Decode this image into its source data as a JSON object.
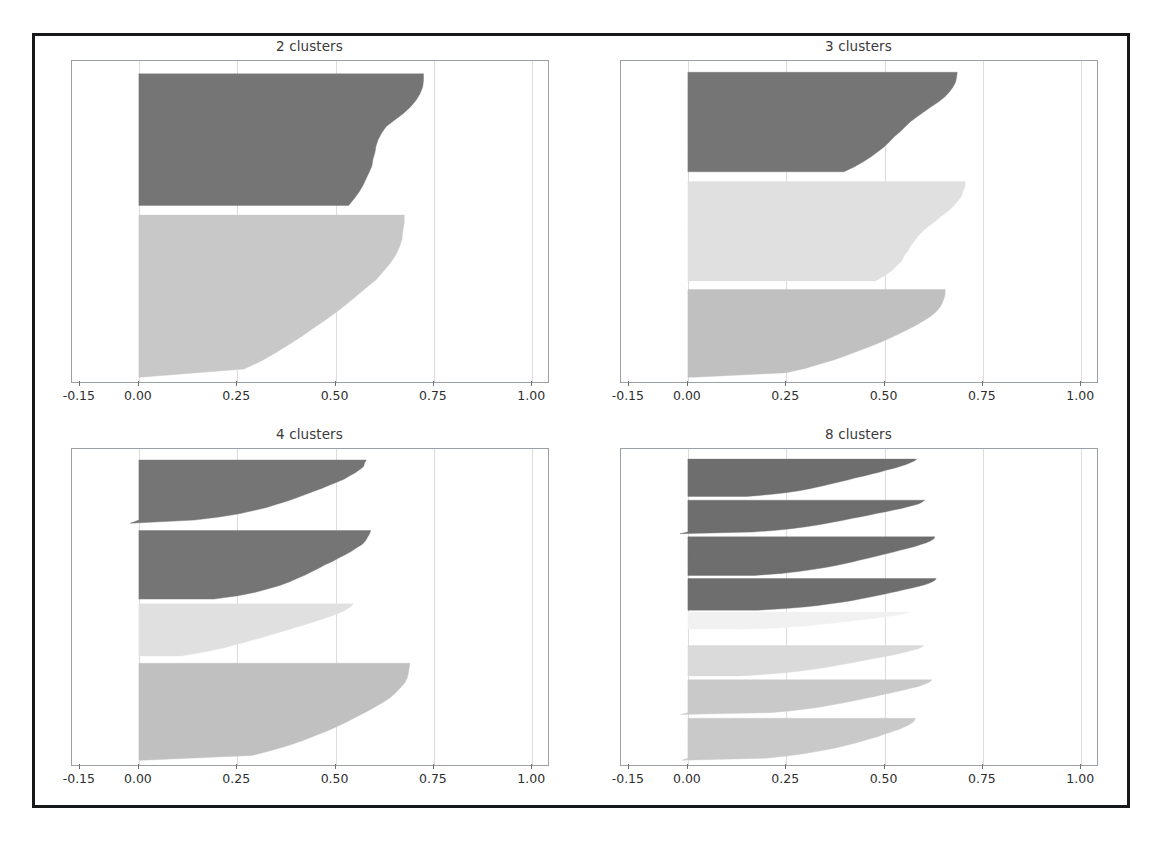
{
  "figure": {
    "kind": "silhouette-plot-grid",
    "background": "#ffffff",
    "frame_color": "#16181a",
    "axis_color": "#9aa0a6",
    "grid_color": "#dcdcdc",
    "tick_label_color": "#2f2f2f",
    "title_color": "#3a3a3a"
  },
  "axis": {
    "tick_labels": [
      "-0.15",
      "0.00",
      "0.25",
      "0.50",
      "0.75",
      "1.00"
    ],
    "tick_values": [
      -0.15,
      0.0,
      0.25,
      0.5,
      0.75,
      1.0
    ],
    "xlim": [
      -0.17,
      1.04
    ],
    "gridline_values": [
      0.0,
      0.25,
      0.5,
      0.75,
      1.0
    ]
  },
  "subplots": [
    {
      "title": "2 clusters",
      "n_clusters": 2
    },
    {
      "title": "3 clusters",
      "n_clusters": 3
    },
    {
      "title": "4 clusters",
      "n_clusters": 4
    },
    {
      "title": "8 clusters",
      "n_clusters": 8
    }
  ],
  "chart_data": {
    "type": "area",
    "xlabel": "",
    "ylabel": "",
    "xlim": [
      -0.17,
      1.04
    ],
    "xticks": [
      -0.15,
      0.0,
      0.25,
      0.5,
      0.75,
      1.0
    ],
    "xticklabels": [
      "-0.15",
      "0.00",
      "0.25",
      "0.50",
      "0.75",
      "1.00"
    ],
    "grid": true,
    "legend": "none",
    "panels": [
      {
        "title": "2 clusters",
        "n_clusters": 2,
        "y_span": [
          0,
          1000
        ],
        "clusters": [
          {
            "index": 0,
            "color": "#757575",
            "y_start": 40,
            "y_end": 450,
            "profile": [
              0.725,
              0.723,
              0.72,
              0.714,
              0.705,
              0.69,
              0.672,
              0.65,
              0.63,
              0.617,
              0.609,
              0.604,
              0.6,
              0.596,
              0.591,
              0.585,
              0.578,
              0.57,
              0.56,
              0.548,
              0.534
            ],
            "min": 0.52,
            "max": 0.726
          },
          {
            "index": 1,
            "color": "#c8c8c8",
            "y_start": 480,
            "y_end": 985,
            "profile": [
              0.675,
              0.674,
              0.672,
              0.668,
              0.661,
              0.651,
              0.638,
              0.621,
              0.601,
              0.578,
              0.553,
              0.527,
              0.5,
              0.472,
              0.443,
              0.413,
              0.382,
              0.348,
              0.311,
              0.268,
              0.005
            ],
            "min": 0.0,
            "max": 0.676
          }
        ]
      },
      {
        "title": "3 clusters",
        "n_clusters": 3,
        "y_span": [
          0,
          1000
        ],
        "clusters": [
          {
            "index": 0,
            "color": "#757575",
            "y_start": 35,
            "y_end": 345,
            "profile": [
              0.685,
              0.683,
              0.68,
              0.674,
              0.665,
              0.652,
              0.636,
              0.618,
              0.6,
              0.582,
              0.566,
              0.551,
              0.538,
              0.525,
              0.512,
              0.498,
              0.483,
              0.466,
              0.447,
              0.424,
              0.398
            ],
            "min": 0.39,
            "max": 0.686
          },
          {
            "index": 1,
            "color": "#e0e0e0",
            "y_start": 375,
            "y_end": 685,
            "profile": [
              0.705,
              0.703,
              0.7,
              0.695,
              0.687,
              0.676,
              0.662,
              0.645,
              0.628,
              0.611,
              0.596,
              0.584,
              0.574,
              0.566,
              0.559,
              0.551,
              0.542,
              0.531,
              0.517,
              0.5,
              0.477
            ],
            "min": 0.47,
            "max": 0.706
          },
          {
            "index": 2,
            "color": "#c0c0c0",
            "y_start": 712,
            "y_end": 985,
            "profile": [
              0.655,
              0.654,
              0.652,
              0.648,
              0.641,
              0.631,
              0.618,
              0.602,
              0.583,
              0.562,
              0.539,
              0.515,
              0.489,
              0.462,
              0.434,
              0.404,
              0.372,
              0.337,
              0.297,
              0.248,
              0.015
            ],
            "min": 0.0,
            "max": 0.656
          }
        ]
      },
      {
        "title": "4 clusters",
        "n_clusters": 4,
        "y_span": [
          0,
          1000
        ],
        "clusters": [
          {
            "index": 0,
            "color": "#757575",
            "y_start": 35,
            "y_end": 235,
            "profile": [
              0.578,
              0.575,
              0.57,
              0.562,
              0.551,
              0.537,
              0.521,
              0.503,
              0.484,
              0.464,
              0.443,
              0.422,
              0.4,
              0.377,
              0.352,
              0.324,
              0.292,
              0.254,
              0.206,
              0.14,
              -0.022
            ],
            "min": -0.03,
            "max": 0.58
          },
          {
            "index": 1,
            "color": "#757575",
            "y_start": 258,
            "y_end": 475,
            "profile": [
              0.588,
              0.586,
              0.582,
              0.576,
              0.567,
              0.555,
              0.541,
              0.525,
              0.508,
              0.491,
              0.474,
              0.457,
              0.44,
              0.422,
              0.403,
              0.382,
              0.358,
              0.33,
              0.296,
              0.252,
              0.19
            ],
            "min": 0.18,
            "max": 0.59
          },
          {
            "index": 2,
            "color": "#e0e0e0",
            "y_start": 490,
            "y_end": 655,
            "profile": [
              0.545,
              0.54,
              0.531,
              0.518,
              0.502,
              0.484,
              0.464,
              0.443,
              0.421,
              0.399,
              0.377,
              0.355,
              0.333,
              0.31,
              0.287,
              0.263,
              0.238,
              0.211,
              0.181,
              0.147,
              0.108
            ],
            "min": 0.1,
            "max": 0.548
          },
          {
            "index": 3,
            "color": "#c0c0c0",
            "y_start": 678,
            "y_end": 985,
            "profile": [
              0.688,
              0.687,
              0.685,
              0.681,
              0.675,
              0.666,
              0.654,
              0.639,
              0.621,
              0.601,
              0.579,
              0.556,
              0.531,
              0.504,
              0.476,
              0.446,
              0.414,
              0.378,
              0.337,
              0.288,
              0.01
            ],
            "min": 0.0,
            "max": 0.689
          }
        ]
      },
      {
        "title": "8 clusters",
        "n_clusters": 8,
        "y_span": [
          0,
          1000
        ],
        "clusters": [
          {
            "index": 0,
            "color": "#6e6e6e",
            "y_start": 32,
            "y_end": 150,
            "profile": [
              0.58,
              0.575,
              0.566,
              0.554,
              0.539,
              0.522,
              0.504,
              0.485,
              0.466,
              0.447,
              0.428,
              0.409,
              0.39,
              0.371,
              0.351,
              0.33,
              0.307,
              0.281,
              0.249,
              0.208,
              0.15
            ],
            "min": 0.14,
            "max": 0.582
          },
          {
            "index": 1,
            "color": "#6e6e6e",
            "y_start": 162,
            "y_end": 268,
            "profile": [
              0.602,
              0.597,
              0.588,
              0.575,
              0.559,
              0.541,
              0.521,
              0.5,
              0.479,
              0.458,
              0.437,
              0.416,
              0.394,
              0.372,
              0.349,
              0.324,
              0.296,
              0.263,
              0.222,
              0.164,
              -0.02
            ],
            "min": -0.03,
            "max": 0.604
          },
          {
            "index": 2,
            "color": "#6e6e6e",
            "y_start": 278,
            "y_end": 400,
            "profile": [
              0.628,
              0.624,
              0.617,
              0.606,
              0.592,
              0.576,
              0.558,
              0.539,
              0.52,
              0.5,
              0.48,
              0.46,
              0.439,
              0.418,
              0.396,
              0.372,
              0.346,
              0.316,
              0.281,
              0.236,
              0.17
            ],
            "min": 0.16,
            "max": 0.63
          },
          {
            "index": 3,
            "color": "#6e6e6e",
            "y_start": 410,
            "y_end": 510,
            "profile": [
              0.632,
              0.629,
              0.623,
              0.613,
              0.601,
              0.586,
              0.57,
              0.552,
              0.534,
              0.515,
              0.496,
              0.477,
              0.457,
              0.436,
              0.414,
              0.39,
              0.363,
              0.332,
              0.294,
              0.246,
              0.18
            ],
            "min": 0.17,
            "max": 0.634
          },
          {
            "index": 4,
            "color": "#f1f1f1",
            "y_start": 516,
            "y_end": 570,
            "profile": [
              0.56,
              0.556,
              0.549,
              0.539,
              0.526,
              0.511,
              0.495,
              0.478,
              0.46,
              0.442,
              0.424,
              0.406,
              0.388,
              0.369,
              0.35,
              0.329,
              0.306,
              0.279,
              0.247,
              0.205,
              0.14
            ],
            "min": 0.13,
            "max": 0.562
          },
          {
            "index": 5,
            "color": "#dadada",
            "y_start": 622,
            "y_end": 718,
            "profile": [
              0.598,
              0.594,
              0.586,
              0.574,
              0.559,
              0.542,
              0.523,
              0.504,
              0.484,
              0.464,
              0.444,
              0.424,
              0.403,
              0.382,
              0.36,
              0.336,
              0.31,
              0.28,
              0.244,
              0.197,
              0.13
            ],
            "min": 0.12,
            "max": 0.6
          },
          {
            "index": 6,
            "color": "#c9c9c9",
            "y_start": 730,
            "y_end": 840,
            "profile": [
              0.62,
              0.616,
              0.608,
              0.597,
              0.583,
              0.566,
              0.548,
              0.529,
              0.509,
              0.489,
              0.468,
              0.447,
              0.426,
              0.404,
              0.381,
              0.356,
              0.329,
              0.297,
              0.259,
              0.209,
              -0.018
            ],
            "min": -0.03,
            "max": 0.622
          },
          {
            "index": 7,
            "color": "#c9c9c9",
            "y_start": 852,
            "y_end": 985,
            "profile": [
              0.578,
              0.575,
              0.57,
              0.562,
              0.552,
              0.54,
              0.526,
              0.511,
              0.495,
              0.478,
              0.46,
              0.441,
              0.421,
              0.4,
              0.377,
              0.352,
              0.324,
              0.291,
              0.251,
              0.198,
              -0.015
            ],
            "min": -0.02,
            "max": 0.58
          }
        ]
      }
    ]
  }
}
